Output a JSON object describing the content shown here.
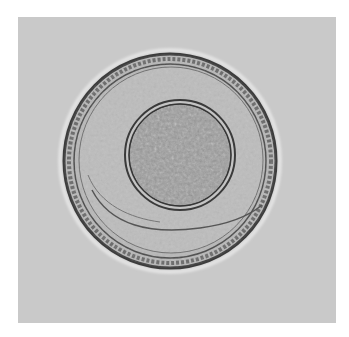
{
  "image": {
    "subject": "microscope image of a round egg with thick striated shell and granular inner embryo",
    "colors": {
      "page_background": "#ffffff",
      "field_background": "#c9c9c9",
      "shell_dark": "#3a3a3a",
      "shell_mid": "#6a6a6a",
      "shell_fill": "#b5b5b5",
      "inner_fill": "#9a9a9a"
    },
    "geometry": {
      "outer_egg": {
        "cx": 170,
        "cy": 161,
        "rx": 106,
        "ry": 107
      },
      "inner_sphere": {
        "cx": 180,
        "cy": 155,
        "r": 52
      }
    }
  }
}
